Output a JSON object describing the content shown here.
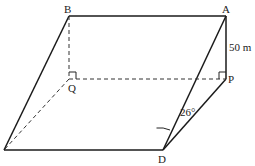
{
  "diagram": {
    "labels": {
      "B": "B",
      "A": "A",
      "Q": "Q",
      "P": "P",
      "D": "D"
    },
    "measurements": {
      "height_AP": "50 m",
      "angle_at_D": "26°"
    },
    "points": {
      "A": [
        226,
        16
      ],
      "B": [
        69,
        16
      ],
      "P": [
        226,
        79
      ],
      "Q": [
        69,
        79
      ],
      "D": [
        163,
        150
      ],
      "C": [
        4,
        150
      ]
    },
    "colors": {
      "line": "#1a1a1a",
      "background": "#ffffff"
    }
  }
}
